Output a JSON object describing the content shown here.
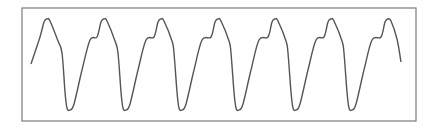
{
  "chart_data": {
    "type": "line",
    "title": "",
    "xlabel": "",
    "ylabel": "",
    "grid": false,
    "legend": null,
    "frame": {
      "left": 22,
      "top": 8,
      "right": 416,
      "bottom": 121,
      "color": "#7a7a7a"
    },
    "line_color": "#555555",
    "series": [
      {
        "name": "waveform",
        "description": "Periodic asymmetric oscillation, 7 peaks and 6 troughs, slow rise with sharp fall",
        "cycles": 6.5,
        "period_px": 57,
        "peaks_x": [
          47,
          104,
          161,
          218,
          275,
          331,
          388
        ],
        "troughs_x": [
          70,
          126,
          182,
          239,
          296,
          352
        ],
        "peak_y": 19,
        "trough_y": 110,
        "start": [
          31,
          64
        ],
        "end": [
          401,
          62
        ]
      }
    ]
  }
}
